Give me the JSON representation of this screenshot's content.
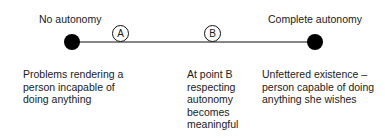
{
  "diagram": {
    "left_end_label": "No autonomy",
    "right_end_label": "Complete autonomy",
    "points": [
      {
        "id": "A",
        "label": "A"
      },
      {
        "id": "B",
        "label": "B"
      }
    ],
    "descriptions": {
      "left": [
        "Problems rendering a",
        "person incapable of",
        "doing anything"
      ],
      "middle": [
        "At point B",
        "respecting",
        "autonomy",
        "becomes",
        "meaningful"
      ],
      "right": [
        "Unfettered existence –",
        "person capable of doing",
        "anything she wishes"
      ]
    },
    "colors": {
      "line": "#111111",
      "dot": "#000000",
      "text": "#1a1a1a"
    }
  }
}
